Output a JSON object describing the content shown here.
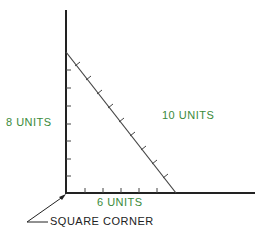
{
  "diagram": {
    "labels": {
      "vertical_side": "8 UNITS",
      "hypotenuse": "10 UNITS",
      "horizontal_side": "6 UNITS",
      "corner": "SQUARE CORNER"
    },
    "colors": {
      "label_green": "#3a8a3a",
      "line_dark": "#222222",
      "background": "#ffffff"
    },
    "geometry": {
      "vertical_units": 8,
      "horizontal_units": 6,
      "hypotenuse_units": 10
    }
  }
}
